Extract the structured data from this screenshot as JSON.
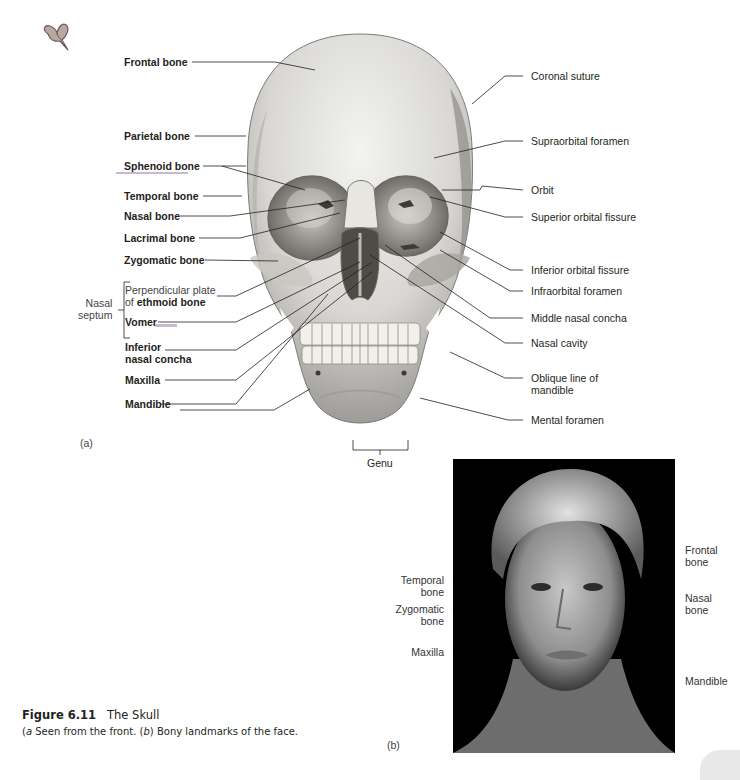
{
  "decor": {
    "heart_icon": "heart-doodle"
  },
  "panel_a": {
    "tag": "(a)",
    "left_labels": [
      {
        "id": "frontal",
        "text": "Frontal bone"
      },
      {
        "id": "parietal",
        "text": "Parietal bone"
      },
      {
        "id": "sphenoid",
        "text": "Sphenoid bone"
      },
      {
        "id": "temporal",
        "text": "Temporal bone"
      },
      {
        "id": "nasal",
        "text": "Nasal bone"
      },
      {
        "id": "lacrimal",
        "text": "Lacrimal bone"
      },
      {
        "id": "zygomatic",
        "text": "Zygomatic bone"
      },
      {
        "id": "perp_plate_1",
        "text": "Perpendicular plate"
      },
      {
        "id": "perp_plate_2a",
        "text": "of "
      },
      {
        "id": "perp_plate_2b",
        "text": "ethmoid bone"
      },
      {
        "id": "vomer",
        "text": "Vomer"
      },
      {
        "id": "inf_concha_1",
        "text": "Inferior"
      },
      {
        "id": "inf_concha_2",
        "text": "nasal concha"
      },
      {
        "id": "maxilla",
        "text": "Maxilla"
      },
      {
        "id": "mandible",
        "text": "Mandible"
      }
    ],
    "bracket_group": {
      "line1": "Nasal",
      "line2": "septum"
    },
    "right_labels": [
      {
        "id": "coronal",
        "text": "Coronal suture"
      },
      {
        "id": "supraorbital",
        "text": "Supraorbital foramen"
      },
      {
        "id": "orbit",
        "text": "Orbit"
      },
      {
        "id": "sup_orbital_fissure",
        "text": "Superior orbital fissure"
      },
      {
        "id": "inf_orbital_fissure",
        "text": "Inferior orbital fissure"
      },
      {
        "id": "infraorbital",
        "text": "Infraorbital foramen"
      },
      {
        "id": "middle_concha",
        "text": "Middle nasal concha"
      },
      {
        "id": "nasal_cavity",
        "text": "Nasal cavity"
      },
      {
        "id": "oblique_1",
        "text": "Oblique line of"
      },
      {
        "id": "oblique_2",
        "text": "mandible"
      },
      {
        "id": "mental",
        "text": "Mental foramen"
      }
    ],
    "bottom_label": "Genu"
  },
  "panel_b": {
    "tag": "(b)",
    "left_labels": [
      {
        "line1": "Temporal",
        "line2": "bone"
      },
      {
        "line1": "Zygomatic",
        "line2": "bone"
      },
      {
        "line1": "Maxilla",
        "line2": ""
      }
    ],
    "right_labels": [
      {
        "line1": "Frontal",
        "line2": "bone"
      },
      {
        "line1": "Nasal",
        "line2": "bone"
      },
      {
        "line1": "Mandible",
        "line2": ""
      }
    ]
  },
  "caption": {
    "figure_number": "Figure 6.11",
    "title": "The Skull",
    "a_tag": "a",
    "a_text": " Seen from the front. (",
    "b_tag": "b",
    "b_text": ") Bony landmarks of the face."
  }
}
